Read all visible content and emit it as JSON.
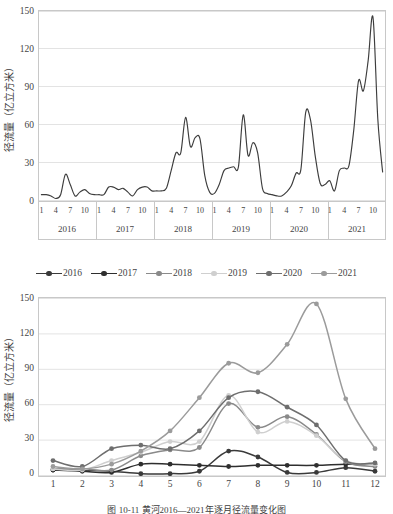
{
  "caption": "图 10-11  黄河2016—2021年逐月径流量变化图",
  "colors": {
    "line_2016": "#3a3a3a",
    "line_2017": "#2e2e2e",
    "line_2018": "#8a8a8a",
    "line_2019": "#c2c2c2",
    "line_2019_alt": "#cfcfcf",
    "line_2020": "#6e6e6e",
    "line_2021": "#9b9b9b",
    "series_line": "#3d3d3d",
    "grid": "#e3e3e3",
    "frame": "#c8c8c8",
    "text": "#444444"
  },
  "top_chart": {
    "ylabel": "径流量（亿立方米）",
    "yticks": [
      "0",
      "30",
      "60",
      "90",
      "120",
      "150"
    ],
    "month_ticks": [
      "1",
      "4",
      "7",
      "10"
    ],
    "years": [
      "2016",
      "2017",
      "2018",
      "2019",
      "2020",
      "2021"
    ]
  },
  "bottom_chart": {
    "ylabel": "径流量（亿立方米）",
    "yticks": [
      "0",
      "30",
      "60",
      "90",
      "120",
      "150"
    ],
    "xticks": [
      "1",
      "2",
      "3",
      "4",
      "5",
      "6",
      "7",
      "8",
      "9",
      "10",
      "11",
      "12"
    ],
    "legend": [
      "2016",
      "2017",
      "2018",
      "2019",
      "2020",
      "2021"
    ]
  },
  "chart_data": [
    {
      "type": "line",
      "title": "",
      "xlabel": "",
      "ylabel": "径流量（亿立方米）",
      "ylim": [
        0,
        150
      ],
      "yticks": [
        0,
        30,
        60,
        90,
        120,
        150
      ],
      "grid": true,
      "legend": "none",
      "x_group_labels": [
        "2016",
        "2017",
        "2018",
        "2019",
        "2020",
        "2021"
      ],
      "x_month_ticks": [
        1,
        4,
        7,
        10
      ],
      "x": [
        "2016-01",
        "2016-02",
        "2016-03",
        "2016-04",
        "2016-05",
        "2016-06",
        "2016-07",
        "2016-08",
        "2016-09",
        "2016-10",
        "2016-11",
        "2016-12",
        "2017-01",
        "2017-02",
        "2017-03",
        "2017-04",
        "2017-05",
        "2017-06",
        "2017-07",
        "2017-08",
        "2017-09",
        "2017-10",
        "2017-11",
        "2017-12",
        "2018-01",
        "2018-02",
        "2018-03",
        "2018-04",
        "2018-05",
        "2018-06",
        "2018-07",
        "2018-08",
        "2018-09",
        "2018-10",
        "2018-11",
        "2018-12",
        "2019-01",
        "2019-02",
        "2019-03",
        "2019-04",
        "2019-05",
        "2019-06",
        "2019-07",
        "2019-08",
        "2019-09",
        "2019-10",
        "2019-11",
        "2019-12",
        "2020-01",
        "2020-02",
        "2020-03",
        "2020-04",
        "2020-05",
        "2020-06",
        "2020-07",
        "2020-08",
        "2020-09",
        "2020-10",
        "2020-11",
        "2020-12",
        "2021-01",
        "2021-02",
        "2021-03",
        "2021-04",
        "2021-05",
        "2021-06",
        "2021-07",
        "2021-08",
        "2021-09",
        "2021-10",
        "2021-11",
        "2021-12"
      ],
      "values": [
        5,
        5,
        4,
        2,
        5,
        21,
        13,
        4,
        7,
        9,
        6,
        5,
        5,
        5,
        11,
        11,
        9,
        10,
        7,
        4,
        9,
        11,
        11,
        8,
        8,
        8,
        10,
        24,
        38,
        38,
        66,
        43,
        50,
        49,
        20,
        7,
        6,
        13,
        24,
        26,
        27,
        27,
        68,
        36,
        46,
        38,
        10,
        6,
        5,
        4,
        4,
        7,
        12,
        22,
        25,
        70,
        64,
        35,
        14,
        13,
        16,
        8,
        24,
        26,
        28,
        56,
        95,
        87,
        111,
        145,
        65,
        23
      ],
      "series_name": "逐月径流量"
    },
    {
      "type": "line",
      "title": "",
      "xlabel": "",
      "ylabel": "径流量（亿立方米）",
      "ylim": [
        0,
        150
      ],
      "yticks": [
        0,
        30,
        60,
        90,
        120,
        150
      ],
      "grid": true,
      "legend": "top",
      "categories": [
        "1",
        "2",
        "3",
        "4",
        "5",
        "6",
        "7",
        "8",
        "9",
        "10",
        "11",
        "12"
      ],
      "series": [
        {
          "name": "2016",
          "color": "#3a3a3a",
          "values": [
            5,
            5,
            4,
            2,
            2,
            4,
            21,
            16,
            3,
            3,
            7,
            4
          ]
        },
        {
          "name": "2017",
          "color": "#2e2e2e",
          "values": [
            5,
            4,
            3,
            10,
            10,
            9,
            8,
            9,
            9,
            9,
            10,
            10
          ]
        },
        {
          "name": "2018",
          "color": "#8a8a8a",
          "values": [
            6,
            6,
            5,
            17,
            22,
            24,
            61,
            41,
            50,
            35,
            12,
            8
          ]
        },
        {
          "name": "2019",
          "color": "#cfcfcf",
          "values": [
            6,
            5,
            13,
            20,
            29,
            29,
            68,
            37,
            46,
            34,
            13,
            10
          ]
        },
        {
          "name": "2020",
          "color": "#6e6e6e",
          "values": [
            13,
            8,
            23,
            26,
            23,
            38,
            66,
            71,
            58,
            43,
            13,
            11
          ]
        },
        {
          "name": "2021",
          "color": "#9b9b9b",
          "values": [
            8,
            6,
            10,
            21,
            38,
            66,
            95,
            87,
            111,
            145,
            65,
            23
          ]
        }
      ]
    }
  ]
}
